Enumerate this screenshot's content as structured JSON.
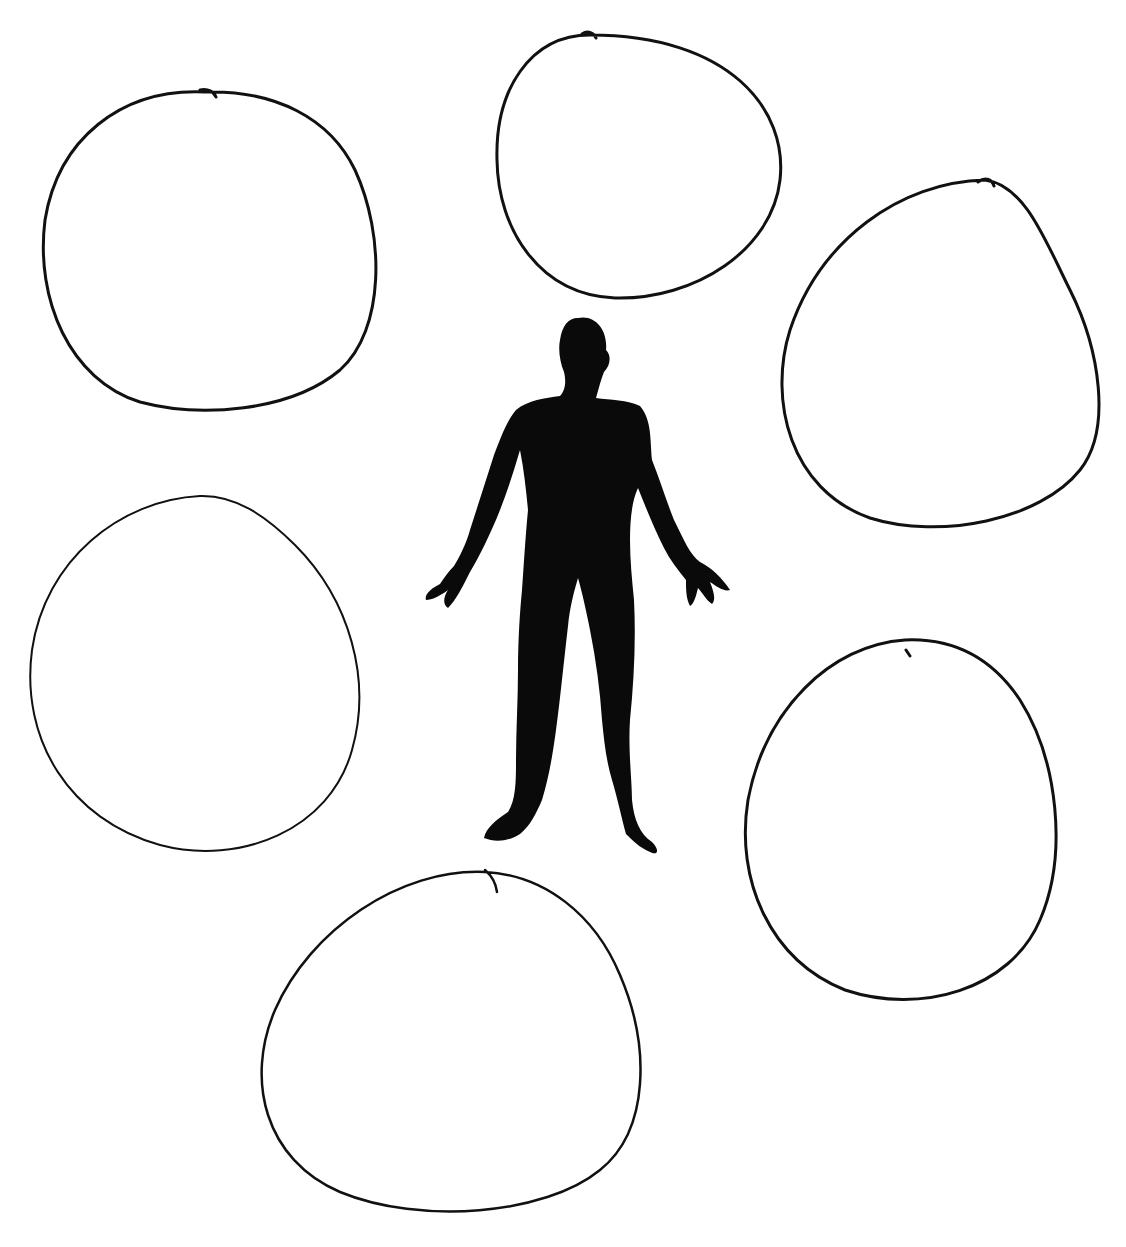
{
  "diagram": {
    "type": "worksheet",
    "colors": {
      "background": "#ffffff",
      "ink": "#111111",
      "figure": "#0a0a0a"
    },
    "figure": {
      "label": "human-silhouette"
    },
    "circles": [
      {
        "id": "top-left",
        "text": ""
      },
      {
        "id": "top-center",
        "text": ""
      },
      {
        "id": "top-right",
        "text": ""
      },
      {
        "id": "middle-left",
        "text": ""
      },
      {
        "id": "middle-right",
        "text": ""
      },
      {
        "id": "bottom-center",
        "text": ""
      }
    ]
  }
}
